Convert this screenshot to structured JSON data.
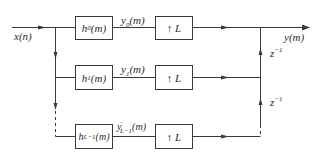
{
  "diagram": {
    "type": "polyphase-synthesis-filter-bank",
    "input": {
      "label": "x(n)"
    },
    "output": {
      "label": "y(m)"
    },
    "branches": [
      {
        "filter": {
          "name": "h",
          "sub": "0",
          "arg": "(m)"
        },
        "signal": {
          "name": "y",
          "sub": "0",
          "sup": "",
          "arg": "(m)"
        },
        "upsampler": "↑ L"
      },
      {
        "filter": {
          "name": "h",
          "sub": "1",
          "arg": "(m)"
        },
        "signal": {
          "name": "y",
          "sub": "1",
          "sup": "",
          "arg": "(m)"
        },
        "upsampler": "↑ L"
      },
      {
        "filter": {
          "name": "h",
          "sub": "L−1",
          "arg": "(m)"
        },
        "signal": {
          "name": "y",
          "sub": "L−1",
          "sup": "′",
          "arg": "(m)"
        },
        "upsampler": "↑ L"
      }
    ],
    "delays": [
      {
        "label": "z",
        "sup": "−1"
      },
      {
        "label": "z",
        "sup": "−1"
      }
    ],
    "colors": {
      "line": "#3a3a3a",
      "text": "#2a2a2a",
      "background": "#ffffff"
    }
  }
}
